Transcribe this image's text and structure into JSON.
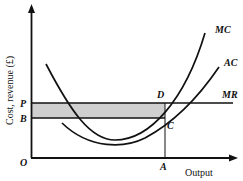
{
  "diagram": {
    "type": "economics-cost-revenue",
    "y_axis_label": "Cost, revenue (£)",
    "x_axis_label": "Output",
    "origin_label": "O",
    "point_labels": {
      "P": "P",
      "B": "B",
      "D": "D",
      "C": "C",
      "A": "A"
    },
    "curve_labels": {
      "mc": "MC",
      "ac": "AC",
      "mr": "MR"
    },
    "colors": {
      "ink": "#111111",
      "shade": "#c8c8c8"
    }
  }
}
